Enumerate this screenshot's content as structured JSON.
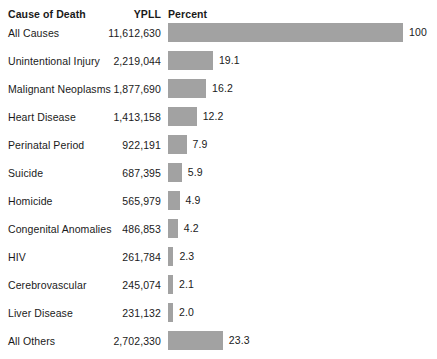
{
  "header": {
    "col_cause": "Cause of Death",
    "col_ypll": "YPLL",
    "col_percent": "Percent"
  },
  "style": {
    "bar_color": "#a2a2a2",
    "background": "#ffffff",
    "text_color": "#1a1a1a"
  },
  "chart_data": {
    "type": "bar",
    "orientation": "horizontal",
    "title": "",
    "xlabel": "Percent",
    "ylabel": "Cause of Death",
    "xlim": [
      0,
      100
    ],
    "grid": false,
    "legend": null,
    "categories": [
      "All Causes",
      "Unintentional Injury",
      "Malignant Neoplasms",
      "Heart Disease",
      "Perinatal Period",
      "Suicide",
      "Homicide",
      "Congenital Anomalies",
      "HIV",
      "Cerebrovascular",
      "Liver Disease",
      "All Others"
    ],
    "values": [
      100,
      19.1,
      16.2,
      12.2,
      7.9,
      5.9,
      4.9,
      4.2,
      2.3,
      2.1,
      2.0,
      23.3
    ],
    "value_labels": [
      "100",
      "19.1",
      "16.2",
      "12.2",
      "7.9",
      "5.9",
      "4.9",
      "4.2",
      "2.3",
      "2.1",
      "2.0",
      "23.3"
    ],
    "ypll": [
      "11,612,630",
      "2,219,044",
      "1,877,690",
      "1,413,158",
      "922,191",
      "687,395",
      "565,979",
      "486,853",
      "261,784",
      "245,074",
      "231,132",
      "2,702,330"
    ]
  },
  "rows": [
    {
      "cause": "All Causes",
      "ypll": "11,612,630",
      "percent": 100,
      "percent_label": "100"
    },
    {
      "cause": "Unintentional Injury",
      "ypll": "2,219,044",
      "percent": 19.1,
      "percent_label": "19.1"
    },
    {
      "cause": "Malignant Neoplasms",
      "ypll": "1,877,690",
      "percent": 16.2,
      "percent_label": "16.2"
    },
    {
      "cause": "Heart Disease",
      "ypll": "1,413,158",
      "percent": 12.2,
      "percent_label": "12.2"
    },
    {
      "cause": "Perinatal Period",
      "ypll": "922,191",
      "percent": 7.9,
      "percent_label": "7.9"
    },
    {
      "cause": "Suicide",
      "ypll": "687,395",
      "percent": 5.9,
      "percent_label": "5.9"
    },
    {
      "cause": "Homicide",
      "ypll": "565,979",
      "percent": 4.9,
      "percent_label": "4.9"
    },
    {
      "cause": "Congenital Anomalies",
      "ypll": "486,853",
      "percent": 4.2,
      "percent_label": "4.2"
    },
    {
      "cause": "HIV",
      "ypll": "261,784",
      "percent": 2.3,
      "percent_label": "2.3"
    },
    {
      "cause": "Cerebrovascular",
      "ypll": "245,074",
      "percent": 2.1,
      "percent_label": "2.1"
    },
    {
      "cause": "Liver Disease",
      "ypll": "231,132",
      "percent": 2.0,
      "percent_label": "2.0"
    },
    {
      "cause": "All Others",
      "ypll": "2,702,330",
      "percent": 23.3,
      "percent_label": "23.3"
    }
  ]
}
